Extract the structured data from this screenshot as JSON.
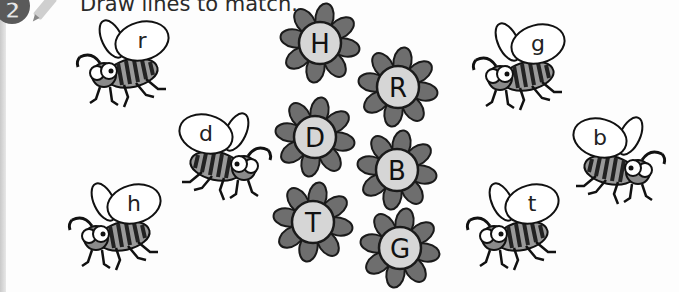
{
  "exercise": {
    "number": "2",
    "instruction": "Draw lines to match."
  },
  "bees": [
    {
      "letter": "r",
      "x": 70,
      "y": 15,
      "facing": "left"
    },
    {
      "letter": "d",
      "x": 168,
      "y": 108,
      "facing": "right"
    },
    {
      "letter": "h",
      "x": 62,
      "y": 178,
      "facing": "left"
    },
    {
      "letter": "g",
      "x": 466,
      "y": 18,
      "facing": "left"
    },
    {
      "letter": "b",
      "x": 562,
      "y": 112,
      "facing": "right"
    },
    {
      "letter": "t",
      "x": 460,
      "y": 178,
      "facing": "left"
    }
  ],
  "flowers": [
    {
      "letter": "H",
      "cx": 320,
      "cy": 43
    },
    {
      "letter": "D",
      "cx": 315,
      "cy": 137
    },
    {
      "letter": "T",
      "cx": 313,
      "cy": 222
    },
    {
      "letter": "R",
      "cx": 398,
      "cy": 87
    },
    {
      "letter": "B",
      "cx": 397,
      "cy": 170
    },
    {
      "letter": "G",
      "cx": 400,
      "cy": 248
    }
  ],
  "colors": {
    "petal": "#6e6e6e",
    "flower_center": "#d6d6d6",
    "outline": "#1a1a1a",
    "badge": "#5a5a5a"
  }
}
